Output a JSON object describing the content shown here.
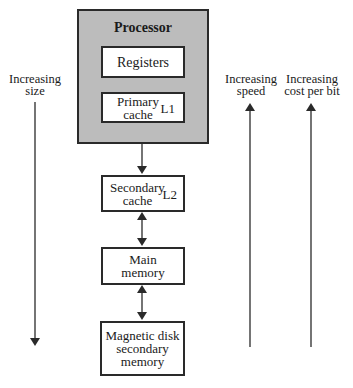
{
  "diagram": {
    "processor": {
      "title": "Processor"
    },
    "registers": {
      "label": "Registers"
    },
    "primary_cache": {
      "line1": "Primary",
      "line2": "cache",
      "tag": "L1"
    },
    "secondary_cache": {
      "line1": "Secondary",
      "line2": "cache",
      "tag": "L2"
    },
    "main_memory": {
      "line1": "Main",
      "line2": "memory"
    },
    "disk": {
      "line1": "Magnetic disk",
      "line2": "secondary",
      "line3": "memory"
    },
    "axes": {
      "size": {
        "line1": "Increasing",
        "line2": "size",
        "direction": "down"
      },
      "speed": {
        "line1": "Increasing",
        "line2": "speed",
        "direction": "up"
      },
      "cost": {
        "line1": "Increasing",
        "line2": "cost per bit",
        "direction": "up"
      }
    },
    "colors": {
      "processor_fill": "#bcbcbc",
      "stroke": "#2a2a2a",
      "background": "#ffffff"
    }
  }
}
